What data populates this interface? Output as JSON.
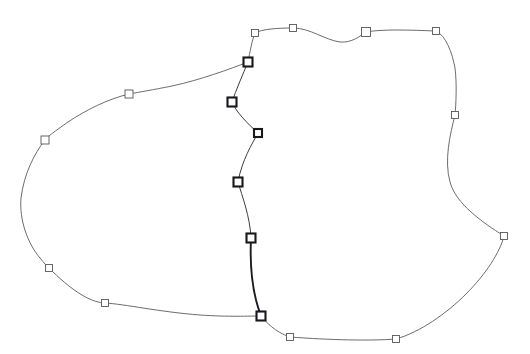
{
  "document": {
    "title": "Spline Contour Diagram",
    "description": "Two-lobe closed contour with square control-point handles",
    "background_color": "#ffffff",
    "width": 530,
    "height": 354
  },
  "style": {
    "outline_stroke_color": "#5a5a63",
    "outline_stroke_width": 0.9,
    "spine_stroke_color": "#3c3c44",
    "spine_stroke_width": 1.0,
    "spine_heavy_stroke_color": "#1c1c22",
    "spine_heavy_stroke_width": 1.9,
    "node_fill_color": "#ffffff",
    "node_outer_stroke_color": "#55555e",
    "node_spine_stroke_color": "#17171c"
  },
  "chart_data": {
    "type": "scatter",
    "title": "",
    "xlabel": "",
    "ylabel": "",
    "xlim": [
      0,
      530
    ],
    "ylim": [
      0,
      354
    ],
    "grid": false,
    "legend": null,
    "curves": [
      {
        "name": "outer-boundary-left-lobe",
        "closed": false,
        "kind": "smooth-spline",
        "path": "M 248 62 C 230 69, 200 80, 172 86 C 152 90, 140 92, 129 94 C 108 99, 86 110, 68 122 C 54 132, 48 136, 45 140 C 34 154, 24 174, 21 198 C 19 220, 28 244, 40 258 C 44 263, 47 266, 49 268 C 58 277, 70 288, 82 295 C 92 301, 100 303, 105 303 C 124 304, 160 312, 200 315 C 228 317, 250 316, 261 316"
      },
      {
        "name": "outer-boundary-right-lobe",
        "closed": false,
        "kind": "smooth-spline",
        "path": "M 248 62 C 250 52, 252 40, 255 33 C 262 29, 278 28, 293 28 C 310 28, 325 40, 340 42 C 352 43, 360 36, 366 32 C 382 29, 410 30, 436 31 C 446 36, 452 52, 455 68 C 457 84, 456 104, 455 115 C 450 135, 444 160, 450 182 C 456 204, 482 222, 504 236 C 500 252, 486 274, 466 294 C 446 314, 420 332, 396 339 C 370 341, 330 340, 290 337 C 275 332, 266 322, 261 316"
      },
      {
        "name": "spine-upper",
        "closed": false,
        "kind": "smooth-spline",
        "path": "M 248 62 C 243 74, 236 90, 232 102 C 236 112, 248 124, 258 133 C 252 144, 242 160, 238 182 C 242 196, 250 216, 251 238"
      },
      {
        "name": "spine-lower-heavy",
        "closed": false,
        "kind": "smooth-spline",
        "path": "M 251 238 C 250 260, 252 284, 256 300 C 258 308, 260 313, 261 316"
      }
    ],
    "nodes": [
      {
        "id": "n1",
        "x": 255,
        "y": 33,
        "size": 7,
        "group": "outer"
      },
      {
        "id": "n2",
        "x": 293,
        "y": 28,
        "size": 7,
        "group": "outer"
      },
      {
        "id": "n3",
        "x": 366,
        "y": 32,
        "size": 9,
        "group": "outer"
      },
      {
        "id": "n4",
        "x": 436,
        "y": 31,
        "size": 7,
        "group": "outer"
      },
      {
        "id": "n5",
        "x": 455,
        "y": 115,
        "size": 7,
        "group": "outer"
      },
      {
        "id": "n6",
        "x": 504,
        "y": 236,
        "size": 7,
        "group": "outer"
      },
      {
        "id": "n7",
        "x": 396,
        "y": 339,
        "size": 7,
        "group": "outer"
      },
      {
        "id": "n8",
        "x": 290,
        "y": 337,
        "size": 7,
        "group": "outer"
      },
      {
        "id": "n9",
        "x": 105,
        "y": 303,
        "size": 7,
        "group": "outer"
      },
      {
        "id": "n10",
        "x": 49,
        "y": 268,
        "size": 7,
        "group": "outer"
      },
      {
        "id": "n11",
        "x": 45,
        "y": 140,
        "size": 8,
        "group": "outer"
      },
      {
        "id": "n12",
        "x": 129,
        "y": 94,
        "size": 8,
        "group": "outer"
      },
      {
        "id": "s1",
        "x": 248,
        "y": 62,
        "size": 9,
        "group": "spine"
      },
      {
        "id": "s2",
        "x": 232,
        "y": 102,
        "size": 9,
        "group": "spine"
      },
      {
        "id": "s3",
        "x": 258,
        "y": 133,
        "size": 8,
        "group": "spine"
      },
      {
        "id": "s4",
        "x": 238,
        "y": 182,
        "size": 9,
        "group": "spine"
      },
      {
        "id": "s5",
        "x": 251,
        "y": 238,
        "size": 9,
        "group": "spine"
      },
      {
        "id": "s6",
        "x": 261,
        "y": 316,
        "size": 9,
        "group": "spine"
      }
    ]
  }
}
